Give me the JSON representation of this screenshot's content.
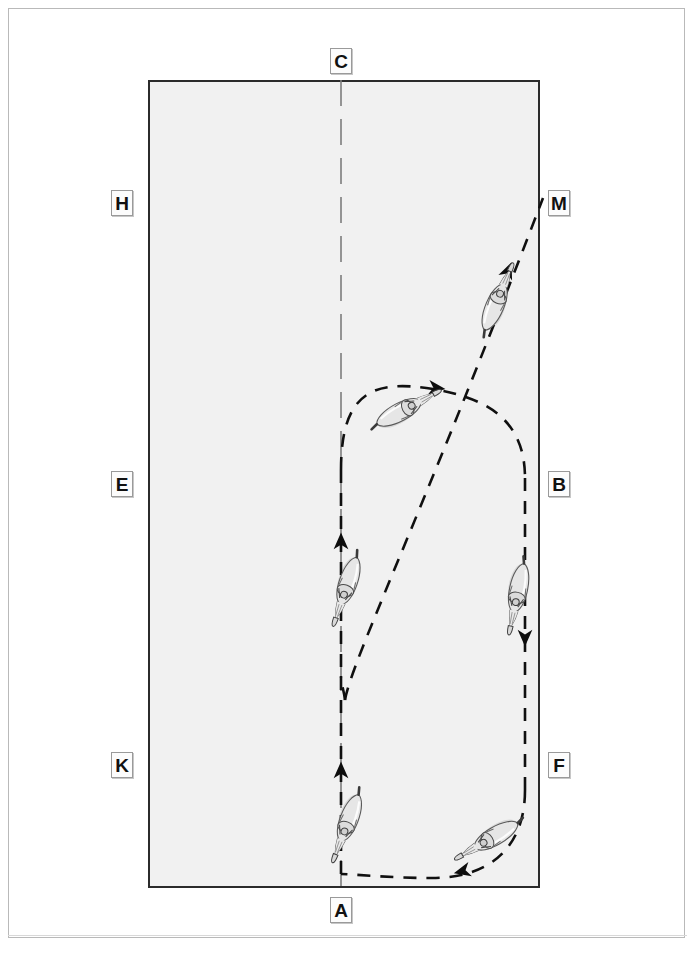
{
  "diagram": {
    "type": "dressage-arena-figure",
    "title": "",
    "arena": {
      "fill_color": "#f1f1f1",
      "border_color": "#2b2b2b",
      "x": 148,
      "y": 80,
      "width": 392,
      "height": 808
    },
    "page": {
      "background": "#ffffff",
      "frame_color": "#b9b9b9"
    },
    "markers": [
      {
        "id": "marker-C",
        "label": "C",
        "position": "top-center"
      },
      {
        "id": "marker-H",
        "label": "H",
        "position": "left-upper"
      },
      {
        "id": "marker-M",
        "label": "M",
        "position": "right-upper"
      },
      {
        "id": "marker-E",
        "label": "E",
        "position": "left-middle"
      },
      {
        "id": "marker-B",
        "label": "B",
        "position": "right-middle"
      },
      {
        "id": "marker-K",
        "label": "K",
        "position": "left-lower"
      },
      {
        "id": "marker-F",
        "label": "F",
        "position": "right-lower"
      },
      {
        "id": "marker-A",
        "label": "A",
        "position": "bottom-center"
      }
    ],
    "center_line": {
      "name": "center-line-A-to-C",
      "style": "long-dash",
      "color": "#6b6b6b",
      "from": "A",
      "to": "C",
      "x": 341,
      "y_top": 80,
      "y_bottom": 888
    },
    "tracks": [
      {
        "name": "oval-loop-track",
        "style": "dashed",
        "color": "#1a1a1a",
        "description": "Large dashed oval loop between the centre line and the right long side"
      },
      {
        "name": "diagonal-track-to-M",
        "style": "dashed",
        "color": "#1a1a1a",
        "description": "Dashed diagonal line running from lower centre up to marker M"
      }
    ],
    "arrowheads": [
      {
        "name": "arrowhead-to-M",
        "direction": "up-right"
      },
      {
        "name": "arrowhead-loop-top",
        "direction": "right"
      },
      {
        "name": "arrowhead-centerline-mid",
        "direction": "up"
      },
      {
        "name": "arrowhead-right-side-down",
        "direction": "down"
      },
      {
        "name": "arrowhead-centerline-low",
        "direction": "up"
      },
      {
        "name": "arrowhead-loop-bottom",
        "direction": "left"
      }
    ],
    "riders": [
      {
        "name": "horse-rider-upper-right-diagonal",
        "heading_deg": 35,
        "x": 494,
        "y": 308
      },
      {
        "name": "horse-rider-loop-top-left",
        "heading_deg": 65,
        "x": 396,
        "y": 414
      },
      {
        "name": "horse-rider-centerline-mid",
        "heading_deg": 160,
        "x": 349,
        "y": 582
      },
      {
        "name": "horse-rider-right-side",
        "heading_deg": 195,
        "x": 520,
        "y": 587
      },
      {
        "name": "horse-rider-centerline-low",
        "heading_deg": 160,
        "x": 350,
        "y": 818
      },
      {
        "name": "horse-rider-loop-bottom-right",
        "heading_deg": 245,
        "x": 494,
        "y": 836
      }
    ]
  }
}
